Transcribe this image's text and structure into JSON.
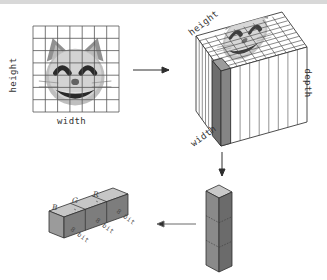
{
  "figure": {
    "background": "#ffffff",
    "grid_color": "#555555",
    "ink_color": "#3a3a3a"
  },
  "image_panel": {
    "height_label": "height",
    "width_label": "width",
    "grid_cols": 7,
    "grid_rows": 7,
    "content_icon": "grinning-cat-face"
  },
  "cube_panel": {
    "height_label": "height",
    "width_label": "width",
    "depth_label": "depth",
    "columns": 9,
    "highlight_color": "#6e6e6e"
  },
  "column_panel": {
    "segments": 3
  },
  "bar_panel": {
    "channels": [
      "B",
      "G",
      "R"
    ],
    "bit_labels": [
      "8 bit",
      "8 bit",
      "8 bit"
    ]
  },
  "arrows": {
    "image_to_cube": "arrow-right",
    "cube_to_column": "arrow-down",
    "column_to_bar": "arrow-left"
  }
}
